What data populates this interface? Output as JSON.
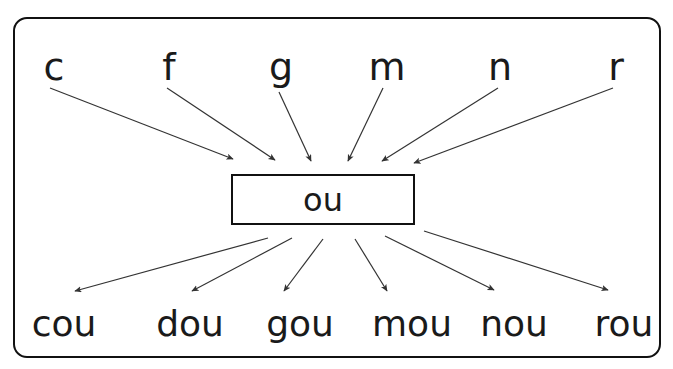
{
  "diagram": {
    "frame": {
      "border_color": "#111111",
      "background_color": "#ffffff"
    },
    "rime": {
      "label": "ou",
      "box_border_color": "#111111"
    },
    "onsets": [
      {
        "label": "c",
        "x": 54,
        "arrow_from": [
          50,
          88
        ],
        "arrow_to": [
          233,
          159
        ]
      },
      {
        "label": "f",
        "x": 169,
        "arrow_from": [
          167,
          88
        ],
        "arrow_to": [
          275,
          160
        ]
      },
      {
        "label": "g",
        "x": 281,
        "arrow_from": [
          279,
          92
        ],
        "arrow_to": [
          311,
          161
        ]
      },
      {
        "label": "m",
        "x": 387,
        "arrow_from": [
          383,
          88
        ],
        "arrow_to": [
          348,
          161
        ]
      },
      {
        "label": "n",
        "x": 500,
        "arrow_from": [
          498,
          88
        ],
        "arrow_to": [
          382,
          161
        ]
      },
      {
        "label": "r",
        "x": 616,
        "arrow_from": [
          613,
          88
        ],
        "arrow_to": [
          414,
          163
        ]
      }
    ],
    "words": [
      {
        "label": "cou",
        "x": 64,
        "arrow_from": [
          268,
          238
        ],
        "arrow_to": [
          75,
          291
        ]
      },
      {
        "label": "dou",
        "x": 190,
        "arrow_from": [
          292,
          238
        ],
        "arrow_to": [
          192,
          291
        ]
      },
      {
        "label": "gou",
        "x": 300,
        "arrow_from": [
          323,
          239
        ],
        "arrow_to": [
          284,
          291
        ]
      },
      {
        "label": "mou",
        "x": 412,
        "arrow_from": [
          355,
          239
        ],
        "arrow_to": [
          387,
          291
        ]
      },
      {
        "label": "nou",
        "x": 514,
        "arrow_from": [
          385,
          236
        ],
        "arrow_to": [
          494,
          290
        ]
      },
      {
        "label": "rou",
        "x": 624,
        "arrow_from": [
          424,
          231
        ],
        "arrow_to": [
          608,
          290
        ]
      }
    ],
    "colors": {
      "ink": "#1a1a1a",
      "line": "#333333",
      "paper": "#ffffff"
    }
  }
}
